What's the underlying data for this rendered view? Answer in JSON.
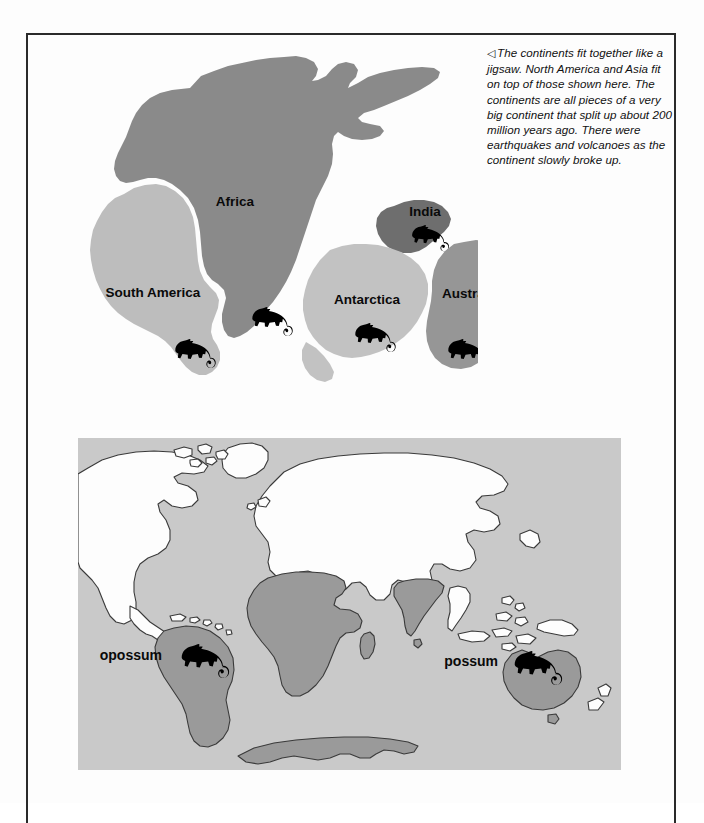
{
  "page": {
    "border_color": "#2a2a2a"
  },
  "caption": {
    "marker": "◁",
    "text": "The continents fit together like a jigsaw. North America and Asia fit on top of those shown here. The continents are all pieces of a very big continent that split up about 200 million years ago. There were earthquakes and volcanoes as the continent slowly broke up."
  },
  "pangaea": {
    "title": "Pangaea reconstruction with fossil marsupial distribution",
    "labels": {
      "africa": "Africa",
      "south_america": "South America",
      "india": "India",
      "antarctica": "Antarctica",
      "australia": "Australia"
    },
    "colors": {
      "africa": "#8a8a8a",
      "south_america": "#bdbdbd",
      "india": "#6e6e6e",
      "antarctica": "#c2c2c2",
      "australia": "#969696",
      "background": "#ffffff",
      "fossil_icon": "#000000"
    },
    "fossil_icons": [
      {
        "name": "marsupial-fossil-south-america",
        "continent": "South America"
      },
      {
        "name": "marsupial-fossil-africa",
        "continent": "Africa"
      },
      {
        "name": "marsupial-fossil-india",
        "continent": "India"
      },
      {
        "name": "marsupial-fossil-antarctica",
        "continent": "Antarctica"
      },
      {
        "name": "marsupial-fossil-australia",
        "continent": "Australia"
      }
    ]
  },
  "worldmap": {
    "title": "Present-day world map showing opossum and possum ranges",
    "labels": {
      "opossum": "opossum",
      "possum": "possum"
    },
    "colors": {
      "ocean": "#c9c9c9",
      "land": "#fdfdfd",
      "highlight": "#9a9a9a",
      "outline": "#3a3a3a",
      "animal_icon": "#000000"
    },
    "highlighted_regions": [
      "South America",
      "Africa",
      "India",
      "Australia",
      "Antarctica"
    ],
    "animal_icons": [
      {
        "name": "opossum-icon",
        "region": "South America"
      },
      {
        "name": "possum-icon",
        "region": "Australia"
      }
    ]
  }
}
